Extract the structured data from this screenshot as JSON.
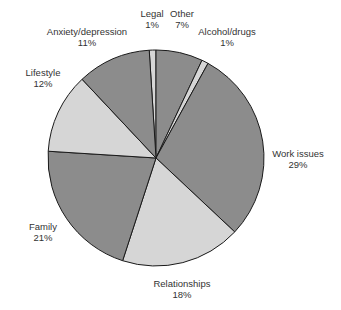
{
  "chart_data": {
    "type": "pie",
    "title": "",
    "start_angle_deg": -3.6,
    "direction": "clockwise",
    "slices": [
      {
        "label": "Legal",
        "value": 1,
        "display": "1%",
        "color": "#d6d6d6"
      },
      {
        "label": "Other",
        "value": 7,
        "display": "7%",
        "color": "#8c8c8c"
      },
      {
        "label": "Alcohol/drugs",
        "value": 1,
        "display": "1%",
        "color": "#d6d6d6"
      },
      {
        "label": "Work issues",
        "value": 29,
        "display": "29%",
        "color": "#8c8c8c"
      },
      {
        "label": "Relationships",
        "value": 18,
        "display": "18%",
        "color": "#d6d6d6"
      },
      {
        "label": "Family",
        "value": 21,
        "display": "21%",
        "color": "#8c8c8c"
      },
      {
        "label": "Lifestyle",
        "value": 12,
        "display": "12%",
        "color": "#d6d6d6"
      },
      {
        "label": "Anxiety/depression",
        "value": 11,
        "display": "11%",
        "color": "#8c8c8c"
      }
    ],
    "label_positions": [
      {
        "x": 152,
        "y": 8
      },
      {
        "x": 182,
        "y": 8
      },
      {
        "x": 227,
        "y": 26
      },
      {
        "x": 298,
        "y": 148
      },
      {
        "x": 182,
        "y": 278
      },
      {
        "x": 43,
        "y": 221
      },
      {
        "x": 43,
        "y": 67
      },
      {
        "x": 87,
        "y": 26
      }
    ],
    "center": {
      "x": 156,
      "y": 158
    },
    "radius": 108
  }
}
